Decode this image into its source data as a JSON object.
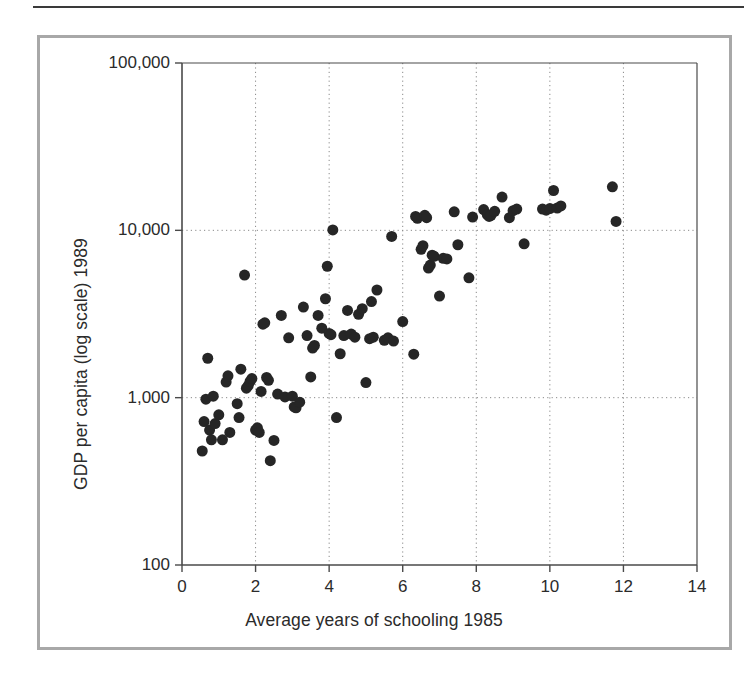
{
  "figure": {
    "background_color": "#ffffff",
    "frame_color": "#a8a8a8",
    "rule_color": "#3a3a3a"
  },
  "chart_data": {
    "type": "scatter",
    "title": "",
    "xlabel": "Average years of schooling 1985",
    "ylabel": "GDP per capita (log scale) 1989",
    "xlim": [
      0,
      14
    ],
    "ylim": [
      100,
      100000
    ],
    "yscale": "log",
    "xscale": "linear",
    "xticks": [
      0,
      2,
      4,
      6,
      8,
      10,
      12,
      14
    ],
    "xticklabels": [
      "0",
      "2",
      "4",
      "6",
      "8",
      "10",
      "12",
      "14"
    ],
    "yticks": [
      100,
      1000,
      10000,
      100000
    ],
    "yticklabels": [
      "100",
      "1,000",
      "10,000",
      "100,000"
    ],
    "grid": true,
    "grid_style": "dotted",
    "grid_color": "#8a8a8a",
    "legend": null,
    "marker": {
      "shape": "circle",
      "color": "#262626",
      "size_px": 11
    },
    "points": [
      [
        0.55,
        480
      ],
      [
        0.6,
        720
      ],
      [
        0.65,
        980
      ],
      [
        0.7,
        1720
      ],
      [
        0.75,
        640
      ],
      [
        0.8,
        560
      ],
      [
        0.85,
        1020
      ],
      [
        0.9,
        700
      ],
      [
        1.0,
        790
      ],
      [
        1.1,
        560
      ],
      [
        1.2,
        1240
      ],
      [
        1.25,
        1350
      ],
      [
        1.3,
        620
      ],
      [
        1.5,
        920
      ],
      [
        1.55,
        760
      ],
      [
        1.6,
        1480
      ],
      [
        1.7,
        5400
      ],
      [
        1.75,
        1140
      ],
      [
        1.8,
        1180
      ],
      [
        1.85,
        1250
      ],
      [
        1.9,
        1300
      ],
      [
        2.0,
        640
      ],
      [
        2.05,
        660
      ],
      [
        2.1,
        620
      ],
      [
        2.15,
        1090
      ],
      [
        2.2,
        2750
      ],
      [
        2.25,
        2800
      ],
      [
        2.3,
        1320
      ],
      [
        2.35,
        1270
      ],
      [
        2.4,
        420
      ],
      [
        2.5,
        555
      ],
      [
        2.6,
        1050
      ],
      [
        2.7,
        3100
      ],
      [
        2.8,
        1010
      ],
      [
        2.9,
        2280
      ],
      [
        3.0,
        1020
      ],
      [
        3.05,
        880
      ],
      [
        3.1,
        870
      ],
      [
        3.2,
        940
      ],
      [
        3.3,
        3480
      ],
      [
        3.4,
        2350
      ],
      [
        3.5,
        1330
      ],
      [
        3.55,
        1980
      ],
      [
        3.6,
        2050
      ],
      [
        3.7,
        3100
      ],
      [
        3.8,
        2600
      ],
      [
        3.9,
        3900
      ],
      [
        3.95,
        6100
      ],
      [
        4.0,
        2420
      ],
      [
        4.05,
        2380
      ],
      [
        4.1,
        10050
      ],
      [
        4.2,
        760
      ],
      [
        4.3,
        1830
      ],
      [
        4.4,
        2350
      ],
      [
        4.5,
        3320
      ],
      [
        4.6,
        2400
      ],
      [
        4.7,
        2300
      ],
      [
        4.8,
        3150
      ],
      [
        4.9,
        3400
      ],
      [
        5.0,
        1230
      ],
      [
        5.1,
        2250
      ],
      [
        5.15,
        3750
      ],
      [
        5.2,
        2300
      ],
      [
        5.3,
        4400
      ],
      [
        5.5,
        2200
      ],
      [
        5.6,
        2280
      ],
      [
        5.7,
        9200
      ],
      [
        5.75,
        2180
      ],
      [
        6.0,
        2850
      ],
      [
        6.3,
        1820
      ],
      [
        6.35,
        12100
      ],
      [
        6.4,
        11800
      ],
      [
        6.5,
        7700
      ],
      [
        6.55,
        8100
      ],
      [
        6.6,
        12300
      ],
      [
        6.65,
        11900
      ],
      [
        6.7,
        5950
      ],
      [
        6.75,
        6200
      ],
      [
        6.8,
        7100
      ],
      [
        6.85,
        7000
      ],
      [
        7.0,
        4050
      ],
      [
        7.1,
        6800
      ],
      [
        7.2,
        6750
      ],
      [
        7.4,
        12900
      ],
      [
        7.5,
        8200
      ],
      [
        7.8,
        5200
      ],
      [
        7.9,
        12000
      ],
      [
        8.2,
        13300
      ],
      [
        8.3,
        12400
      ],
      [
        8.35,
        12100
      ],
      [
        8.4,
        12300
      ],
      [
        8.5,
        13000
      ],
      [
        8.7,
        15800
      ],
      [
        8.9,
        11900
      ],
      [
        9.0,
        13100
      ],
      [
        9.1,
        13400
      ],
      [
        9.3,
        8300
      ],
      [
        9.8,
        13400
      ],
      [
        9.9,
        13200
      ],
      [
        10.0,
        13500
      ],
      [
        10.1,
        17300
      ],
      [
        10.2,
        13600
      ],
      [
        10.3,
        14000
      ],
      [
        11.7,
        18200
      ],
      [
        11.8,
        11300
      ]
    ]
  }
}
